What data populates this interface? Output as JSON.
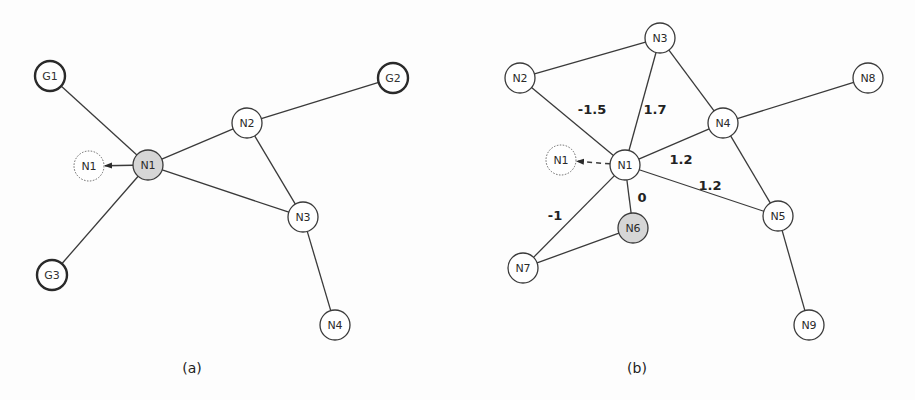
{
  "panels": [
    {
      "caption": "(a)",
      "caption_pos": [
        192,
        368
      ],
      "nodes": [
        {
          "id": "G1",
          "label": "G1",
          "x": 50,
          "y": 76,
          "kind": "goal"
        },
        {
          "id": "G2",
          "label": "G2",
          "x": 393,
          "y": 78,
          "kind": "goal"
        },
        {
          "id": "G3",
          "label": "G3",
          "x": 52,
          "y": 275,
          "kind": "goal"
        },
        {
          "id": "N1",
          "label": "N1",
          "x": 148,
          "y": 165,
          "kind": "active"
        },
        {
          "id": "N1ghost",
          "label": "N1",
          "x": 89,
          "y": 166,
          "kind": "ghost"
        },
        {
          "id": "N2",
          "label": "N2",
          "x": 247,
          "y": 123,
          "kind": "normal"
        },
        {
          "id": "N3",
          "label": "N3",
          "x": 303,
          "y": 217,
          "kind": "normal"
        },
        {
          "id": "N4",
          "label": "N4",
          "x": 335,
          "y": 325,
          "kind": "normal"
        }
      ],
      "edges": [
        {
          "from": "G1",
          "to": "N1"
        },
        {
          "from": "G3",
          "to": "N1"
        },
        {
          "from": "N1",
          "to": "N2"
        },
        {
          "from": "N2",
          "to": "G2"
        },
        {
          "from": "N2",
          "to": "N3"
        },
        {
          "from": "N1",
          "to": "N3"
        },
        {
          "from": "N3",
          "to": "N4"
        }
      ],
      "arrows": [
        {
          "from": "N1",
          "to": "N1ghost",
          "style": "solid"
        }
      ],
      "weights": []
    },
    {
      "caption": "(b)",
      "caption_pos": [
        637,
        368
      ],
      "nodes": [
        {
          "id": "N1",
          "label": "N1",
          "x": 625,
          "y": 165,
          "kind": "normal"
        },
        {
          "id": "N1ghost",
          "label": "N1",
          "x": 561,
          "y": 160,
          "kind": "ghost"
        },
        {
          "id": "N2",
          "label": "N2",
          "x": 520,
          "y": 78,
          "kind": "normal"
        },
        {
          "id": "N3",
          "label": "N3",
          "x": 660,
          "y": 38,
          "kind": "normal"
        },
        {
          "id": "N4",
          "label": "N4",
          "x": 723,
          "y": 123,
          "kind": "normal"
        },
        {
          "id": "N5",
          "label": "N5",
          "x": 778,
          "y": 216,
          "kind": "normal"
        },
        {
          "id": "N6",
          "label": "N6",
          "x": 633,
          "y": 228,
          "kind": "active"
        },
        {
          "id": "N7",
          "label": "N7",
          "x": 523,
          "y": 268,
          "kind": "normal"
        },
        {
          "id": "N8",
          "label": "N8",
          "x": 868,
          "y": 78,
          "kind": "normal"
        },
        {
          "id": "N9",
          "label": "N9",
          "x": 809,
          "y": 325,
          "kind": "normal"
        }
      ],
      "edges": [
        {
          "from": "N2",
          "to": "N3"
        },
        {
          "from": "N2",
          "to": "N1"
        },
        {
          "from": "N3",
          "to": "N1"
        },
        {
          "from": "N3",
          "to": "N4"
        },
        {
          "from": "N4",
          "to": "N8"
        },
        {
          "from": "N1",
          "to": "N4"
        },
        {
          "from": "N4",
          "to": "N5"
        },
        {
          "from": "N1",
          "to": "N5"
        },
        {
          "from": "N1",
          "to": "N6"
        },
        {
          "from": "N1",
          "to": "N7"
        },
        {
          "from": "N6",
          "to": "N7"
        },
        {
          "from": "N5",
          "to": "N9"
        }
      ],
      "arrows": [
        {
          "from": "N1",
          "to": "N1ghost",
          "style": "dashed"
        }
      ],
      "weights": [
        {
          "label": "-1.5",
          "x": 592,
          "y": 109
        },
        {
          "label": "1.7",
          "x": 655,
          "y": 109
        },
        {
          "label": "1.2",
          "x": 681,
          "y": 159
        },
        {
          "label": "1.2",
          "x": 710,
          "y": 185
        },
        {
          "label": "0",
          "x": 642,
          "y": 197
        },
        {
          "label": "-1",
          "x": 555,
          "y": 215
        }
      ]
    }
  ],
  "node_radius": 15,
  "colors": {
    "stroke": "#3a3a3a",
    "active_fill": "#d6d6d6",
    "background": "#fdfdfd"
  }
}
